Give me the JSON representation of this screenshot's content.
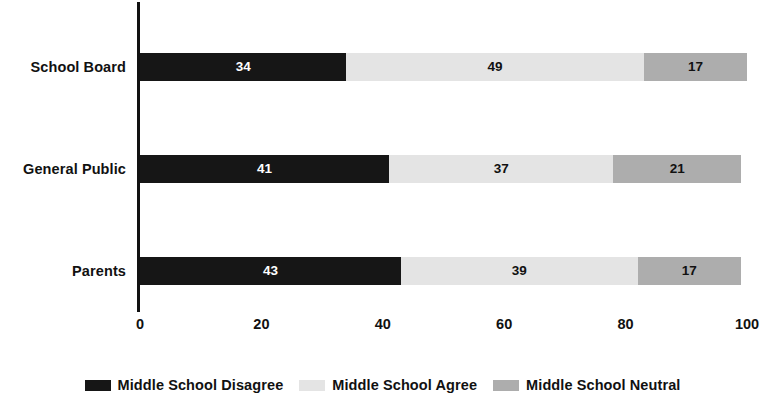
{
  "chart_data": {
    "type": "bar",
    "orientation": "horizontal",
    "stacked": true,
    "stack_mode": "percent",
    "title": "",
    "subtitle": "",
    "xlabel": "",
    "ylabel": "",
    "categories": [
      "School Board",
      "General Public",
      "Parents"
    ],
    "series": [
      {
        "name": "Middle School Disagree",
        "color": "#161616",
        "values": [
          34,
          41,
          43
        ]
      },
      {
        "name": "Middle School Agree",
        "color": "#e4e4e4",
        "values": [
          49,
          37,
          39
        ]
      },
      {
        "name": "Middle School Neutral",
        "color": "#adadad",
        "values": [
          17,
          21,
          17
        ]
      }
    ],
    "xlim": [
      0,
      100
    ],
    "xticks": [
      0,
      20,
      40,
      60,
      80,
      100
    ],
    "xtick_labels": [
      "0",
      "20",
      "40",
      "60",
      "80",
      "100"
    ],
    "grid": false,
    "legend_position": "bottom",
    "data_labels": true,
    "background_color": "#ffffff",
    "axis_color": "#111111",
    "text_color": "#111111"
  },
  "legend": {
    "items": [
      {
        "label": "Middle School Disagree",
        "color": "#161616"
      },
      {
        "label": "Middle School Agree",
        "color": "#e4e4e4"
      },
      {
        "label": "Middle School Neutral",
        "color": "#adadad"
      }
    ]
  }
}
